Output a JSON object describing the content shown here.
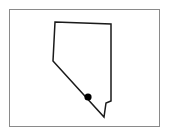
{
  "map": {
    "region": "Nevada",
    "frame": {
      "x": 9,
      "y": 9,
      "width": 151,
      "height": 118,
      "stroke": "#8a8a8a"
    },
    "outline": {
      "stroke": "#1a1a1a",
      "stroke_width": 1.5,
      "fill": "#ffffff",
      "points": "55,22 111,24 111,101 106,103 105,110 104,117 53,61"
    },
    "marker": {
      "label": "location-marker",
      "cx": 88,
      "cy": 97,
      "r": 3.6,
      "color": "#000000"
    }
  }
}
